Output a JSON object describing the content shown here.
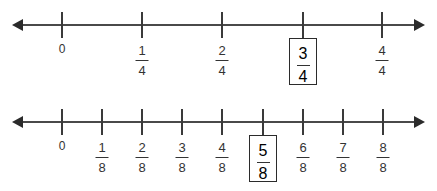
{
  "background_color": "#ffffff",
  "line_color": "#4a4a4a",
  "text_color": "#333333",
  "box_border_color": "#2b2b2b",
  "number_lines": [
    {
      "id": "fourths",
      "denominator": 4,
      "axis_y": 25,
      "axis_left": 22,
      "axis_right": 415,
      "left_arrow": "arrow-left",
      "right_arrow": "arrow-right",
      "ticks": [
        {
          "x": 62,
          "label_kind": "whole",
          "whole": "0",
          "numerator": "",
          "denominator": "",
          "highlighted": false
        },
        {
          "x": 142,
          "label_kind": "fraction",
          "whole": "",
          "numerator": "1",
          "denominator": "4",
          "highlighted": false
        },
        {
          "x": 222,
          "label_kind": "fraction",
          "whole": "",
          "numerator": "2",
          "denominator": "4",
          "highlighted": false
        },
        {
          "x": 303,
          "label_kind": "fraction",
          "whole": "",
          "numerator": "3",
          "denominator": "4",
          "highlighted": true
        },
        {
          "x": 382,
          "label_kind": "fraction",
          "whole": "",
          "numerator": "4",
          "denominator": "4",
          "highlighted": false
        }
      ]
    },
    {
      "id": "eighths",
      "denominator": 8,
      "axis_y": 122,
      "axis_left": 22,
      "axis_right": 415,
      "left_arrow": "arrow-left",
      "right_arrow": "arrow-right",
      "ticks": [
        {
          "x": 62,
          "label_kind": "whole",
          "whole": "0",
          "numerator": "",
          "denominator": "",
          "highlighted": false
        },
        {
          "x": 102,
          "label_kind": "fraction",
          "whole": "",
          "numerator": "1",
          "denominator": "8",
          "highlighted": false
        },
        {
          "x": 142,
          "label_kind": "fraction",
          "whole": "",
          "numerator": "2",
          "denominator": "8",
          "highlighted": false
        },
        {
          "x": 182,
          "label_kind": "fraction",
          "whole": "",
          "numerator": "3",
          "denominator": "8",
          "highlighted": false
        },
        {
          "x": 222,
          "label_kind": "fraction",
          "whole": "",
          "numerator": "4",
          "denominator": "8",
          "highlighted": false
        },
        {
          "x": 263,
          "label_kind": "fraction",
          "whole": "",
          "numerator": "5",
          "denominator": "8",
          "highlighted": true
        },
        {
          "x": 303,
          "label_kind": "fraction",
          "whole": "",
          "numerator": "6",
          "denominator": "8",
          "highlighted": false
        },
        {
          "x": 343,
          "label_kind": "fraction",
          "whole": "",
          "numerator": "7",
          "denominator": "8",
          "highlighted": false
        },
        {
          "x": 383,
          "label_kind": "fraction",
          "whole": "",
          "numerator": "8",
          "denominator": "8",
          "highlighted": false
        }
      ]
    }
  ]
}
